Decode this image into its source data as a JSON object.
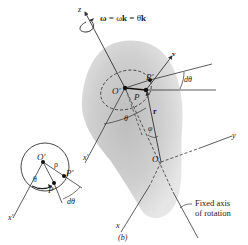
{
  "figure": {
    "caption": "(b)",
    "omega_equation": {
      "omega": "ω",
      "eq1": " = ω",
      "k1": "k",
      "eq2": " = θ̇",
      "k2": "k"
    },
    "main_labels": {
      "z_axis": "z",
      "y_axis": "y",
      "x_axis": "x",
      "x_prime_axis": "x′",
      "v_vector": "v",
      "origin": "O",
      "o_prime": "O′",
      "point_p": "P",
      "point_p_prime": "P′",
      "r_vector": "r",
      "phi_angle": "φ",
      "theta_angle": "θ",
      "d_theta": "dθ",
      "fixed_axis_line1": "Fixed axis",
      "fixed_axis_line2": "of rotation"
    },
    "inset_labels": {
      "o_prime": "O′",
      "rho": "ρ",
      "theta": "θ",
      "point_p": "P",
      "point_p_prime": "P′",
      "d_theta": "dθ",
      "x_prime_axis": "x′"
    },
    "colors": {
      "line": "#333333",
      "body_fill_center": "#c8c8c8",
      "body_fill_edge": "#e2e2e2",
      "text": "#222222"
    }
  }
}
